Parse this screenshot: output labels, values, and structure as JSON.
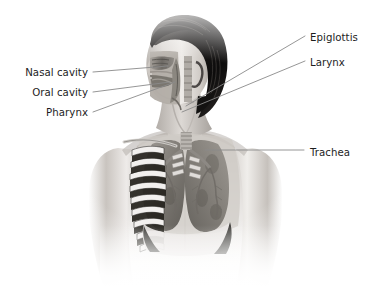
{
  "figure": {
    "width": 370,
    "height": 289,
    "background_color": "#ffffff",
    "illustration": {
      "name": "human-head-and-thorax-cutaway",
      "description": "Grayscale medical illustration of a human head, neck and upper torso in three-quarter view, with a sagittal cutaway of the face revealing the nasal cavity, oral cavity and pharynx, and an anterior cutaway of the chest revealing the ribcage, trachea, bronchi, lungs and diaphragm.",
      "style": "grayscale pencil and airbrush rendering",
      "hair_color": "#1a1a1a",
      "skin_tone": "#d8d4d0",
      "organ_tone": "#8d8a85"
    }
  },
  "labels": [
    {
      "id": "nasal-cavity",
      "text": "Nasal cavity",
      "side": "left",
      "text_x": 88,
      "text_y": 72,
      "leader": {
        "x1": 93,
        "y1": 72,
        "x2": 168,
        "y2": 66
      }
    },
    {
      "id": "oral-cavity",
      "text": "Oral cavity",
      "side": "left",
      "text_x": 88,
      "text_y": 92,
      "leader": {
        "x1": 93,
        "y1": 92,
        "x2": 170,
        "y2": 82
      }
    },
    {
      "id": "pharynx",
      "text": "Pharynx",
      "side": "left",
      "text_x": 88,
      "text_y": 112,
      "leader": {
        "x1": 93,
        "y1": 112,
        "x2": 175,
        "y2": 82
      }
    },
    {
      "id": "epiglottis",
      "text": "Epiglottis",
      "side": "right",
      "text_x": 310,
      "text_y": 37,
      "leader": {
        "x1": 305,
        "y1": 36,
        "x2": 186,
        "y2": 106
      }
    },
    {
      "id": "larynx",
      "text": "Larynx",
      "side": "right",
      "text_x": 310,
      "text_y": 62,
      "leader": {
        "x1": 305,
        "y1": 61,
        "x2": 182,
        "y2": 112
      }
    },
    {
      "id": "trachea",
      "text": "Trachea",
      "side": "right",
      "text_x": 310,
      "text_y": 152,
      "leader": {
        "x1": 304,
        "y1": 150,
        "x2": 205,
        "y2": 150
      }
    }
  ],
  "leader_line": {
    "color": "#8a8a8a",
    "width": 0.9
  }
}
